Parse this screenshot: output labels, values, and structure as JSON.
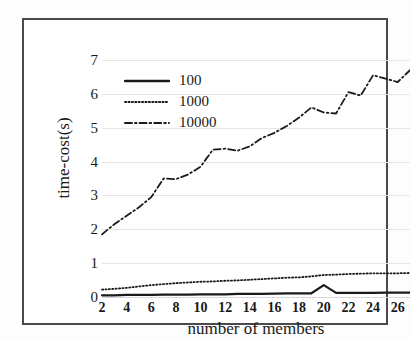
{
  "chart_data": {
    "type": "line",
    "title": "",
    "xlabel": "number of members",
    "ylabel": "time-cost(s)",
    "xlim": [
      2,
      27
    ],
    "ylim": [
      0,
      7
    ],
    "grid": "horizontal",
    "legend_position": "top-left-inside",
    "x_tick_labels": [
      "2",
      "4",
      "6",
      "8",
      "10",
      "12",
      "14",
      "16",
      "18",
      "20",
      "22",
      "24",
      "26"
    ],
    "x_tick_values": [
      2,
      4,
      6,
      8,
      10,
      12,
      14,
      16,
      18,
      20,
      22,
      24,
      26
    ],
    "y_tick_labels": [
      "0",
      "1",
      "2",
      "3",
      "4",
      "5",
      "6",
      "7"
    ],
    "y_tick_values": [
      0,
      1,
      2,
      3,
      4,
      5,
      6,
      7
    ],
    "x": [
      2,
      3,
      4,
      5,
      6,
      7,
      8,
      9,
      10,
      11,
      12,
      13,
      14,
      15,
      16,
      17,
      18,
      19,
      20,
      21,
      22,
      23,
      24,
      25,
      26,
      27
    ],
    "series": [
      {
        "name": "100",
        "style": "solid",
        "color": "#1a1a1a",
        "values": [
          0.05,
          0.05,
          0.06,
          0.06,
          0.06,
          0.07,
          0.07,
          0.07,
          0.08,
          0.08,
          0.08,
          0.09,
          0.09,
          0.09,
          0.1,
          0.11,
          0.11,
          0.11,
          0.35,
          0.12,
          0.12,
          0.12,
          0.12,
          0.13,
          0.13,
          0.13
        ]
      },
      {
        "name": "1000",
        "style": "dotted",
        "color": "#1a1a1a",
        "values": [
          0.22,
          0.24,
          0.27,
          0.31,
          0.35,
          0.38,
          0.41,
          0.43,
          0.45,
          0.46,
          0.48,
          0.49,
          0.51,
          0.53,
          0.55,
          0.57,
          0.58,
          0.61,
          0.65,
          0.66,
          0.68,
          0.69,
          0.7,
          0.7,
          0.7,
          0.71
        ]
      },
      {
        "name": "10000",
        "style": "dash-dot",
        "color": "#1a1a1a",
        "values": [
          1.85,
          2.15,
          2.4,
          2.65,
          2.95,
          3.5,
          3.48,
          3.62,
          3.85,
          4.35,
          4.38,
          4.32,
          4.45,
          4.7,
          4.85,
          5.05,
          5.3,
          5.6,
          5.45,
          5.42,
          6.05,
          5.95,
          6.55,
          6.45,
          6.35,
          6.7
        ]
      }
    ]
  },
  "legend": {
    "items": [
      {
        "label": "100",
        "style": "solid"
      },
      {
        "label": "1000",
        "style": "dotted"
      },
      {
        "label": "10000",
        "style": "dash-dot"
      }
    ]
  }
}
